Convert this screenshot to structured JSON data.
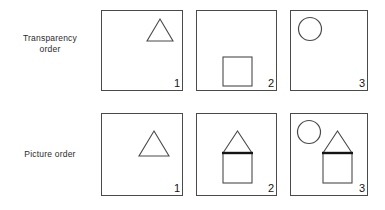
{
  "figure": {
    "caption_title": "Transparency order and Picture order shape-construction sequences",
    "background_color": "#ffffff",
    "line_color": "#4a4a4a",
    "bold_line_color": "#141414",
    "text_color": "#2b2b2b",
    "rows": [
      {
        "id": "transparency-order",
        "label": "Transparency\norder",
        "label_lines": [
          "Transparency",
          "order"
        ],
        "panels": [
          {
            "index_label": "1",
            "frame": {
              "x": 101,
              "y": 10,
              "w": 82,
              "h": 81
            },
            "shapes": [
              {
                "kind": "triangle",
                "name": "triangle-outline",
                "x": 146,
                "y": 18,
                "w": 26,
                "h": 22,
                "bold_base": false
              }
            ]
          },
          {
            "index_label": "2",
            "frame": {
              "x": 196,
              "y": 10,
              "w": 81,
              "h": 81
            },
            "shapes": [
              {
                "kind": "square",
                "name": "square-outline",
                "x": 222,
                "y": 56,
                "w": 29,
                "h": 29
              }
            ]
          },
          {
            "index_label": "3",
            "frame": {
              "x": 290,
              "y": 10,
              "w": 78,
              "h": 81
            },
            "shapes": [
              {
                "kind": "circle",
                "name": "circle-outline",
                "x": 297,
                "y": 16,
                "d": 24
              }
            ]
          }
        ]
      },
      {
        "id": "picture-order",
        "label": "Picture order",
        "label_lines": [
          "Picture order"
        ],
        "panels": [
          {
            "index_label": "1",
            "frame": {
              "x": 101,
              "y": 113,
              "w": 82,
              "h": 83
            },
            "shapes": [
              {
                "kind": "triangle",
                "name": "triangle-outline",
                "x": 138,
                "y": 130,
                "w": 30,
                "h": 25,
                "bold_base": false
              }
            ]
          },
          {
            "index_label": "2",
            "frame": {
              "x": 196,
              "y": 113,
              "w": 81,
              "h": 83
            },
            "shapes": [
              {
                "kind": "house",
                "name": "house-shape",
                "x": 222,
                "y": 130,
                "w": 29,
                "h": 52,
                "roof_h": 22,
                "bold_base": true
              }
            ]
          },
          {
            "index_label": "3",
            "frame": {
              "x": 290,
              "y": 113,
              "w": 78,
              "h": 83
            },
            "shapes": [
              {
                "kind": "circle",
                "name": "circle-outline",
                "x": 296,
                "y": 119,
                "d": 24
              },
              {
                "kind": "house",
                "name": "house-shape",
                "x": 322,
                "y": 130,
                "w": 29,
                "h": 52,
                "roof_h": 22,
                "bold_base": true
              }
            ]
          }
        ]
      }
    ]
  }
}
